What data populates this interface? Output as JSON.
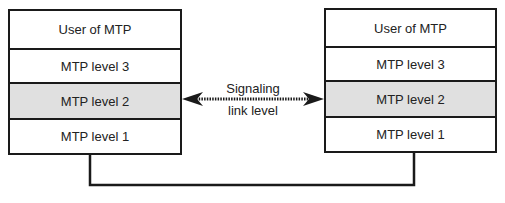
{
  "left_stack": {
    "layers": [
      {
        "label": "User of MTP",
        "shaded": false
      },
      {
        "label": "MTP level 3",
        "shaded": false
      },
      {
        "label": "MTP level 2",
        "shaded": true
      },
      {
        "label": "MTP level 1",
        "shaded": false
      }
    ]
  },
  "right_stack": {
    "layers": [
      {
        "label": "User of MTP",
        "shaded": false
      },
      {
        "label": "MTP level 3",
        "shaded": false
      },
      {
        "label": "MTP level 2",
        "shaded": true
      },
      {
        "label": "MTP level 1",
        "shaded": false
      }
    ]
  },
  "link": {
    "line1": "Signaling",
    "line2": "link level"
  },
  "colors": {
    "shaded": "#e0e0e0",
    "stroke": "#1a1a1a"
  }
}
